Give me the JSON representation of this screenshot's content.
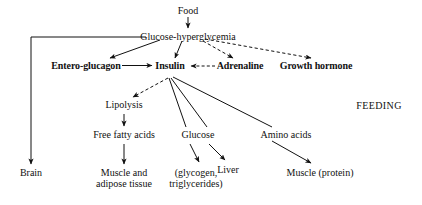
{
  "diagram": {
    "title_label": "FEEDING",
    "nodes": [
      {
        "id": "food",
        "label": "Food",
        "x": 188,
        "y": 5,
        "bold": false
      },
      {
        "id": "glucose_hyp",
        "label": "Glucose-hyperglycemia",
        "x": 188,
        "y": 31,
        "bold": false
      },
      {
        "id": "entero",
        "label": "Entero-glucagon",
        "x": 86,
        "y": 65,
        "bold": true
      },
      {
        "id": "insulin",
        "label": "Insulin",
        "x": 170,
        "y": 65,
        "bold": true
      },
      {
        "id": "adrenaline",
        "label": "Adrenaline",
        "x": 240,
        "y": 65,
        "bold": true
      },
      {
        "id": "growth",
        "label": "Growth hormone",
        "x": 316,
        "y": 65,
        "bold": true
      },
      {
        "id": "lipolysis",
        "label": "Lipolysis",
        "x": 124,
        "y": 102,
        "bold": false
      },
      {
        "id": "ffa",
        "label": "Free fatty acids",
        "x": 124,
        "y": 132,
        "bold": false
      },
      {
        "id": "glucose2",
        "label": "Glucose",
        "x": 198,
        "y": 132,
        "bold": false
      },
      {
        "id": "amino",
        "label": "Amino acids",
        "x": 286,
        "y": 132,
        "bold": false
      },
      {
        "id": "brain",
        "label": "Brain",
        "x": 31,
        "y": 170,
        "bold": false
      },
      {
        "id": "liver",
        "label": "Liver",
        "x": 228,
        "y": 168,
        "bold": false
      },
      {
        "id": "muscle_prot",
        "label": "Muscle (protein)",
        "x": 320,
        "y": 170,
        "bold": false
      },
      {
        "id": "feeding",
        "label": "FEEDING",
        "x": 379,
        "y": 103,
        "bold": false
      }
    ],
    "multiline_nodes": [
      {
        "id": "muscle_adipose",
        "line1": "Muscle and",
        "line2": "adipose tissue",
        "x": 124,
        "y": 170
      },
      {
        "id": "glycogen_trig",
        "line1": "(glycogen,",
        "line2": "triglycerides)",
        "x": 196,
        "y": 170
      }
    ],
    "edges": [
      {
        "id": "food-to-glucose",
        "from": "food",
        "to": "glucose_hyp",
        "style": "solid",
        "shape": "straight"
      },
      {
        "id": "glucose-to-brain",
        "from": "glucose_hyp",
        "to": "brain",
        "style": "solid",
        "shape": "elbow"
      },
      {
        "id": "glucose-to-entero",
        "from": "glucose_hyp",
        "to": "entero",
        "style": "solid",
        "shape": "straight"
      },
      {
        "id": "glucose-to-insulin",
        "from": "glucose_hyp",
        "to": "insulin",
        "style": "solid",
        "shape": "straight"
      },
      {
        "id": "glucose-to-adrenaline",
        "from": "glucose_hyp",
        "to": "adrenaline",
        "style": "dashed",
        "shape": "straight"
      },
      {
        "id": "glucose-to-growth-hormone",
        "from": "glucose_hyp",
        "to": "growth",
        "style": "dashed",
        "shape": "straight"
      },
      {
        "id": "entero-to-insulin",
        "from": "entero",
        "to": "insulin",
        "style": "solid",
        "shape": "straight"
      },
      {
        "id": "adrenaline-to-insulin",
        "from": "adrenaline",
        "to": "insulin",
        "style": "dashed",
        "shape": "straight"
      },
      {
        "id": "insulin-to-lipolysis",
        "from": "insulin",
        "to": "lipolysis",
        "style": "dashed",
        "shape": "straight"
      },
      {
        "id": "insulin-to-glucose2",
        "from": "insulin",
        "to": "glucose2",
        "style": "solid",
        "shape": "straight"
      },
      {
        "id": "insulin-to-liver-branch",
        "from": "insulin",
        "to": "liver",
        "style": "solid",
        "shape": "straight"
      },
      {
        "id": "insulin-to-amino-acids",
        "from": "insulin",
        "to": "amino",
        "style": "solid",
        "shape": "straight"
      },
      {
        "id": "lipolysis-to-ffa",
        "from": "lipolysis",
        "to": "ffa",
        "style": "solid",
        "shape": "straight"
      },
      {
        "id": "ffa-to-muscle-adipose",
        "from": "ffa",
        "to": "muscle_adipose",
        "style": "solid",
        "shape": "straight"
      },
      {
        "id": "glucose2-to-glycogen",
        "from": "glucose2",
        "to": "glycogen_trig",
        "style": "solid",
        "shape": "straight"
      },
      {
        "id": "glucose2-to-liver",
        "from": "glucose2",
        "to": "liver",
        "style": "solid",
        "shape": "straight"
      },
      {
        "id": "amino-to-muscle-protein",
        "from": "amino",
        "to": "muscle_prot",
        "style": "solid",
        "shape": "straight"
      }
    ],
    "colors": {
      "ink": "#111111",
      "background": "#ffffff"
    }
  }
}
